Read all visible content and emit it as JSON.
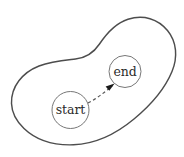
{
  "figure": {
    "kind": "blob-region-with-path",
    "background_color": "#ffffff",
    "canvas": {
      "width": 184,
      "height": 157
    }
  },
  "region": {
    "name": "region-outline",
    "stroke_color": "#4d4d4d",
    "stroke_width": 1.45,
    "fill": "none",
    "path": "M 11.5 103.5 C 11.0 86.5 22.5 72.5 39.0 66.0 C 52.0 60.8 64.0 60.2 75.5 59.0 C 86.5 57.8 93.5 53.0 99.5 44.0 C 107.5 32.0 116.0 23.0 128.0 19.2 C 143.5 14.3 158.0 19.0 167.5 30.5 C 177.0 42.0 177.8 57.5 172.0 71.5 C 165.0 88.5 151.5 104.5 134.0 119.0 C 115.0 134.8 94.5 144.0 73.5 144.8 C 54.0 145.5 36.0 140.0 24.0 128.5 C 15.5 120.4 11.8 112.0 11.5 103.5 Z"
  },
  "nodes": [
    {
      "id": "start",
      "label": "start",
      "cx": 70.5,
      "cy": 110.0,
      "r": 18.5,
      "stroke_color": "#777777",
      "text_color": "#2b2b2b"
    },
    {
      "id": "end",
      "label": "end",
      "cx": 125.0,
      "cy": 71.5,
      "r": 16.0,
      "stroke_color": "#777777",
      "text_color": "#2b2b2b"
    }
  ],
  "connector": {
    "name": "start-to-end-arrow",
    "from": "start",
    "to": "end",
    "style": "dashed",
    "stroke_color": "#555555",
    "dash_pattern": "3.2 2.6",
    "path": "M 88.0 103.0 C 96.0 99.0 104.5 92.5 112.5 85.5",
    "arrow_head": {
      "tip_x": 114.6,
      "tip_y": 83.4,
      "points": "114.6,83.4 105.6,86.6 109.3,90.7",
      "fill": "#1a1a1a"
    }
  }
}
